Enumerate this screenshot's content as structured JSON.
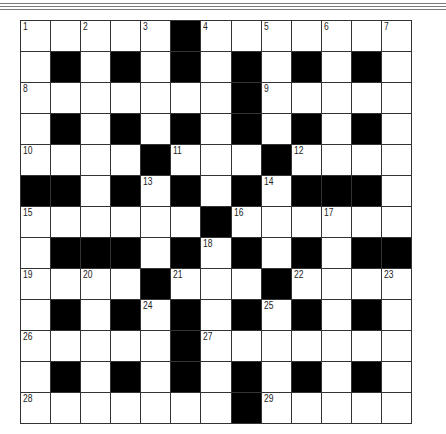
{
  "puzzle": {
    "rows": 13,
    "cols": 13,
    "colors": {
      "black": "#000000",
      "white": "#ffffff",
      "line": "#333333"
    },
    "grid": [
      "..... .......",
      ". . . . . . .",
      "....... .....",
      ". . . . . . .",
      ".... .... ...",
      "  . . . .   .",
      "...... ......",
      ".   . . . .  ",
      ".... .... ...",
      ". . . . . . .",
      "..... .......",
      ". . . . . . .",
      "....... ....."
    ],
    "numbers": [
      {
        "r": 0,
        "c": 0,
        "n": "1"
      },
      {
        "r": 0,
        "c": 2,
        "n": "2"
      },
      {
        "r": 0,
        "c": 4,
        "n": "3"
      },
      {
        "r": 0,
        "c": 6,
        "n": "4"
      },
      {
        "r": 0,
        "c": 8,
        "n": "5"
      },
      {
        "r": 0,
        "c": 10,
        "n": "6"
      },
      {
        "r": 0,
        "c": 12,
        "n": "7"
      },
      {
        "r": 2,
        "c": 0,
        "n": "8"
      },
      {
        "r": 2,
        "c": 8,
        "n": "9"
      },
      {
        "r": 4,
        "c": 0,
        "n": "10"
      },
      {
        "r": 4,
        "c": 5,
        "n": "11"
      },
      {
        "r": 4,
        "c": 9,
        "n": "12"
      },
      {
        "r": 5,
        "c": 4,
        "n": "13"
      },
      {
        "r": 5,
        "c": 8,
        "n": "14"
      },
      {
        "r": 6,
        "c": 0,
        "n": "15"
      },
      {
        "r": 6,
        "c": 7,
        "n": "16"
      },
      {
        "r": 6,
        "c": 10,
        "n": "17"
      },
      {
        "r": 7,
        "c": 6,
        "n": "18"
      },
      {
        "r": 8,
        "c": 0,
        "n": "19"
      },
      {
        "r": 8,
        "c": 2,
        "n": "20"
      },
      {
        "r": 8,
        "c": 5,
        "n": "21"
      },
      {
        "r": 8,
        "c": 9,
        "n": "22"
      },
      {
        "r": 8,
        "c": 12,
        "n": "23"
      },
      {
        "r": 9,
        "c": 4,
        "n": "24"
      },
      {
        "r": 9,
        "c": 8,
        "n": "25"
      },
      {
        "r": 10,
        "c": 0,
        "n": "26"
      },
      {
        "r": 10,
        "c": 6,
        "n": "27"
      },
      {
        "r": 12,
        "c": 0,
        "n": "28"
      },
      {
        "r": 12,
        "c": 8,
        "n": "29"
      }
    ]
  }
}
